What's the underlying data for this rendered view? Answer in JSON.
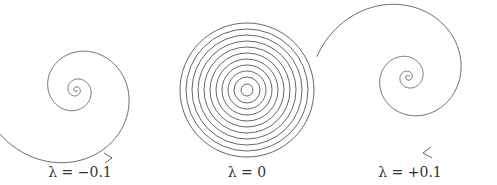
{
  "figure": {
    "panels": [
      {
        "id": "stable-spiral",
        "label": "λ = −0.1",
        "lambda": -0.1,
        "center": [
          76,
          90
        ],
        "direction": "inward"
      },
      {
        "id": "center-circles",
        "label": "λ = 0",
        "lambda": 0,
        "center": [
          247,
          90
        ],
        "direction": "closed"
      },
      {
        "id": "unstable-spiral",
        "label": "λ = +0.1",
        "lambda": 0.1,
        "center": [
          408,
          77
        ],
        "direction": "outward"
      }
    ],
    "stroke_color": "#555555"
  }
}
